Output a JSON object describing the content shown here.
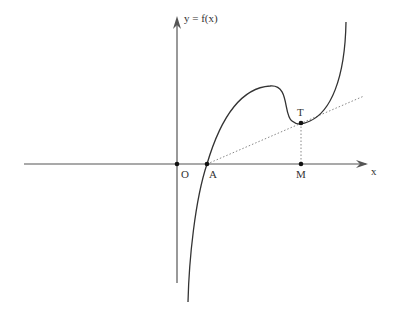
{
  "diagram": {
    "type": "function-graph",
    "colors": {
      "axis": "#555555",
      "curve": "#333333",
      "tangent": "#888888",
      "point": "#111111",
      "label": "#333333"
    },
    "axes": {
      "x_label": "x",
      "y_label": "y = f(x)"
    },
    "points": {
      "origin": "O",
      "a": "A",
      "m": "M",
      "t": "T"
    },
    "lines": {
      "curve": "graph of f",
      "tangent": "tangent line from A touching curve at T",
      "projection": "vertical dotted segment from T to M"
    }
  }
}
